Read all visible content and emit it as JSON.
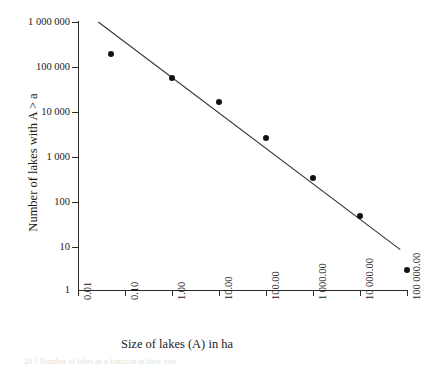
{
  "chart_data": {
    "type": "scatter",
    "title": "",
    "xlabel": "Size of lakes (A) in ha",
    "ylabel": "Number of lakes with A > a",
    "xscale": "log",
    "yscale": "log",
    "xlim": [
      0.01,
      100000
    ],
    "ylim": [
      1,
      1000000
    ],
    "grid": false,
    "legend": null,
    "xticks": [
      0.01,
      0.1,
      1,
      10,
      100,
      1000,
      10000,
      100000
    ],
    "xtick_labels": [
      "0.01",
      "0.10",
      "1.00",
      "10.00",
      "100.00",
      "1 000.00",
      "10 000.00",
      "100 000.00"
    ],
    "yticks": [
      1,
      10,
      100,
      1000,
      10000,
      100000,
      1000000
    ],
    "ytick_labels": [
      "1",
      "10",
      "100",
      "1 000",
      "10 000",
      "100 000",
      "1 000 000"
    ],
    "x": [
      0.05,
      1.0,
      10.0,
      100.0,
      1000.0,
      10000.0,
      100000.0
    ],
    "y": [
      190000,
      57000,
      16000,
      2500,
      320,
      45,
      2.8
    ],
    "series": [
      {
        "name": "Lakes cumulative count",
        "marker": "filled-circle",
        "color": "#111111",
        "points": [
          {
            "x": 0.05,
            "y": 190000
          },
          {
            "x": 1.0,
            "y": 57000
          },
          {
            "x": 10.0,
            "y": 16000
          },
          {
            "x": 100.0,
            "y": 2500
          },
          {
            "x": 1000.0,
            "y": 320
          },
          {
            "x": 10000.0,
            "y": 45
          },
          {
            "x": 100000.0,
            "y": 2.8
          }
        ]
      },
      {
        "name": "Power-law fit line",
        "type": "line",
        "color": "#333333",
        "endpoints": [
          {
            "x": 0.027,
            "y": 1000000
          },
          {
            "x": 72000,
            "y": 8.0
          }
        ]
      }
    ],
    "annotations": []
  },
  "axes": {
    "y_title": "Number of lakes with A > a",
    "x_title": "Size of lakes (A) in ha",
    "y_labels": [
      "1 000 000",
      "100 000",
      "10 000",
      "1 000",
      "100",
      "10",
      "1"
    ],
    "x_labels": [
      "0.01",
      "0.10",
      "1.00",
      "10.00",
      "100.00",
      "1 000.00",
      "10 000.00",
      "100 000.00"
    ]
  },
  "caption": {
    "text": "20.5   Number of lakes as a function of their size"
  },
  "colors": {
    "marker": "#111111",
    "line": "#333333",
    "axis": "#2b2b2b",
    "text": "#1a1a1a",
    "background": "#ffffff"
  }
}
